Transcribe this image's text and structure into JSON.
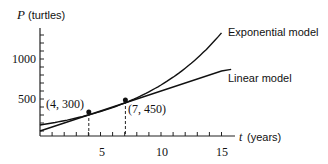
{
  "chart_data": {
    "type": "line",
    "title": "",
    "xlabel": "t (years)",
    "ylabel": "P (turtles)",
    "xlim": [
      0,
      15
    ],
    "ylim": [
      0,
      1300
    ],
    "x_ticks": [
      5,
      10,
      15
    ],
    "y_ticks": [
      500,
      1000
    ],
    "x_tick_labels": [
      "5",
      "10",
      "15"
    ],
    "y_tick_labels": [
      "500",
      "1000"
    ],
    "grid": false,
    "series": [
      {
        "name": "Exponential model",
        "formula": "P = 300*(1.5)^((t-4)/3)",
        "x": [
          0,
          4,
          7,
          10,
          13,
          15
        ],
        "values": [
          175,
          300,
          450,
          675,
          1013,
          1323
        ]
      },
      {
        "name": "Linear model",
        "formula": "P = 50t + 100",
        "x": [
          0,
          4,
          7,
          15
        ],
        "values": [
          100,
          300,
          450,
          850
        ]
      }
    ],
    "annotations": [
      {
        "label": "(4, 300)",
        "x": 4,
        "y": 300
      },
      {
        "label": "(7, 450)",
        "x": 7,
        "y": 450
      }
    ],
    "legend_position": "inline-right"
  },
  "labels": {
    "y_axis_var": "P",
    "y_axis_unit": "(turtles)",
    "x_axis_var": "t",
    "x_axis_unit": "(years)",
    "exp_label": "Exponential model",
    "lin_label": "Linear model",
    "pt1": "(4, 300)",
    "pt2": "(7, 450)",
    "y500": "500",
    "y1000": "1000",
    "x5": "5",
    "x10": "10",
    "x15": "15"
  }
}
